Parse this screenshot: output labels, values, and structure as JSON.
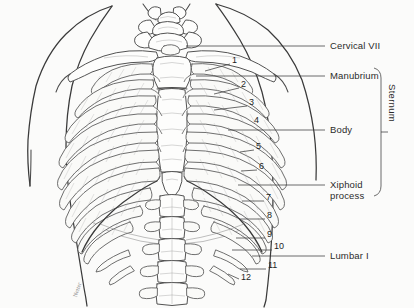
{
  "figure": {
    "background_color": "#fbfbfa",
    "ink_color": "#3a3a3a",
    "label_color": "#2b2b2b"
  },
  "labels": [
    {
      "id": "cervical-vii",
      "text": "Cervical VII",
      "x": 330,
      "y": 40,
      "leader_y": 46,
      "leader_x1": 186,
      "leader_x2": 325
    },
    {
      "id": "manubrium",
      "text": "Manubrium",
      "x": 330,
      "y": 70,
      "leader_y": 76,
      "leader_x1": 196,
      "leader_x2": 325
    },
    {
      "id": "body",
      "text": "Body",
      "x": 330,
      "y": 124,
      "leader_y": 130,
      "leader_x1": 228,
      "leader_x2": 325
    },
    {
      "id": "xiphoid",
      "text": "Xiphoid",
      "x": 330,
      "y": 179,
      "leader_y": 185,
      "leader_x1": 238,
      "leader_x2": 325
    },
    {
      "id": "xiphoid-2",
      "text": "process",
      "x": 330,
      "y": 190,
      "leader_y": null,
      "leader_x1": null,
      "leader_x2": null
    },
    {
      "id": "lumbar-i",
      "text": "Lumbar I",
      "x": 330,
      "y": 250,
      "leader_y": 256,
      "leader_x1": 252,
      "leader_x2": 325
    }
  ],
  "bracket": {
    "label": "Sternum",
    "label_x": 396,
    "label_y": 106,
    "x": 381,
    "y_top": 68,
    "y_bottom": 196,
    "tick_y": 132
  },
  "rib_numbers": [
    {
      "n": "1",
      "tx": 232,
      "ty": 60,
      "lx1": 205,
      "ly1": 71,
      "lx2": 230,
      "ly2": 64
    },
    {
      "n": "2",
      "tx": 241,
      "ty": 84,
      "lx1": 214,
      "ly1": 94,
      "lx2": 239,
      "ly2": 88
    },
    {
      "n": "3",
      "tx": 249,
      "ty": 102,
      "lx1": 214,
      "ly1": 110,
      "lx2": 247,
      "ly2": 106
    },
    {
      "n": "4",
      "tx": 254,
      "ty": 120,
      "lx1": 254,
      "ly1": 124,
      "lx2": 254,
      "ly2": 124
    },
    {
      "n": "5",
      "tx": 256,
      "ty": 146,
      "lx1": 240,
      "ly1": 152,
      "lx2": 254,
      "ly2": 150
    },
    {
      "n": "6",
      "tx": 259,
      "ty": 166,
      "lx1": 241,
      "ly1": 171,
      "lx2": 257,
      "ly2": 170
    },
    {
      "n": "7",
      "tx": 266,
      "ty": 197,
      "lx1": 242,
      "ly1": 201,
      "lx2": 264,
      "ly2": 201
    },
    {
      "n": "8",
      "tx": 267,
      "ty": 215,
      "lx1": 239,
      "ly1": 219,
      "lx2": 265,
      "ly2": 219
    },
    {
      "n": "9",
      "tx": 267,
      "ty": 234,
      "lx1": 236,
      "ly1": 238,
      "lx2": 265,
      "ly2": 238
    },
    {
      "n": "10",
      "tx": 274,
      "ty": 246,
      "lx1": 232,
      "ly1": 250,
      "lx2": 272,
      "ly2": 250
    },
    {
      "n": "11",
      "tx": 268,
      "ty": 265,
      "lx1": 240,
      "ly1": 269,
      "lx2": 266,
      "ly2": 269
    },
    {
      "n": "12",
      "tx": 241,
      "ty": 277,
      "lx1": 228,
      "ly1": 274,
      "lx2": 239,
      "ly2": 279
    }
  ],
  "signature": {
    "text": "Netter"
  }
}
